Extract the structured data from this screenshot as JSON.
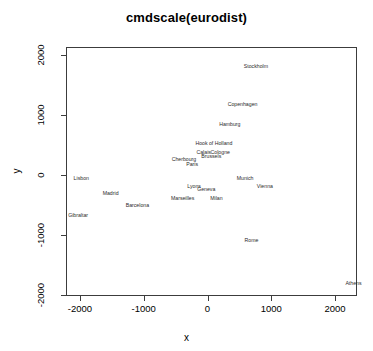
{
  "chart_data": {
    "type": "scatter",
    "title": "cmdscale(eurodist)",
    "xlabel": "x",
    "ylabel": "y",
    "xlim": [
      -2500,
      2500
    ],
    "ylim": [
      -2100,
      2100
    ],
    "xticks": [
      "-2000",
      "-1000",
      "0",
      "1000",
      "2000"
    ],
    "xtick_values": [
      -2000,
      -1000,
      0,
      1000,
      2000
    ],
    "yticks": [
      "2000",
      "1000",
      "0",
      "-1000",
      "-2000"
    ],
    "ytick_values": [
      2000,
      1000,
      0,
      -1000,
      -2000
    ],
    "grid": false,
    "legend": false,
    "marker": "text-label",
    "points": [
      {
        "label": "Athens",
        "x": 2290,
        "y": -1800
      },
      {
        "label": "Barcelona",
        "x": -1100,
        "y": -500
      },
      {
        "label": "Brussels",
        "x": 60,
        "y": 310
      },
      {
        "label": "Calais",
        "x": -60,
        "y": 390
      },
      {
        "label": "Cherbourg",
        "x": -370,
        "y": 260
      },
      {
        "label": "Cologne",
        "x": 200,
        "y": 380
      },
      {
        "label": "Copenhagen",
        "x": 550,
        "y": 1180
      },
      {
        "label": "Geneva",
        "x": -20,
        "y": -240
      },
      {
        "label": "Gibraltar",
        "x": -2030,
        "y": -670
      },
      {
        "label": "Hamburg",
        "x": 350,
        "y": 850
      },
      {
        "label": "Hook of Holland",
        "x": 100,
        "y": 540
      },
      {
        "label": "Lisbon",
        "x": -1980,
        "y": -50
      },
      {
        "label": "Lyons",
        "x": -210,
        "y": -180
      },
      {
        "label": "Madrid",
        "x": -1520,
        "y": -300
      },
      {
        "label": "Marseilles",
        "x": -390,
        "y": -390
      },
      {
        "label": "Milan",
        "x": 140,
        "y": -390
      },
      {
        "label": "Munich",
        "x": 590,
        "y": -50
      },
      {
        "label": "Paris",
        "x": -240,
        "y": 190
      },
      {
        "label": "Rome",
        "x": 690,
        "y": -1090
      },
      {
        "label": "Stockholm",
        "x": 760,
        "y": 1810
      },
      {
        "label": "Vienna",
        "x": 900,
        "y": -190
      }
    ]
  },
  "colors": {
    "background": "#ffffff",
    "axis": "#3c3c3c",
    "text": "#000000",
    "label": "#2b2b2b"
  }
}
